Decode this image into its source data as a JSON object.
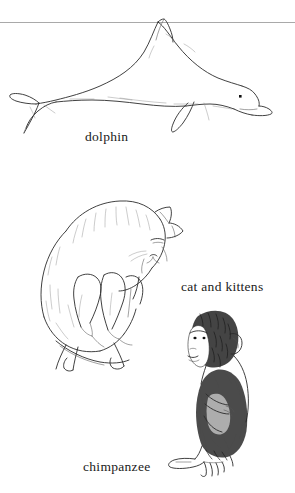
{
  "page": {
    "background_color": "#ffffff",
    "ink_color": "#2b2b2b",
    "rule_color": "#a9a9a9",
    "divider": "horizontal-rule"
  },
  "figures": [
    {
      "id": "dolphin",
      "subject": "dolphin",
      "caption": "dolphin",
      "style": "pen-and-ink line drawing",
      "orientation": "facing right, arched body, dorsal fin touching top rule"
    },
    {
      "id": "cat-and-kittens",
      "subject": "cat and kittens",
      "caption": "cat and kittens",
      "style": "pen-and-ink line drawing with light stippling",
      "orientation": "cat curled on side, head lowered right, kittens nursing below"
    },
    {
      "id": "chimpanzee",
      "subject": "chimpanzee",
      "caption": "chimpanzee",
      "style": "dense pen-and-ink hatching",
      "orientation": "seated in profile, facing left, knees drawn up"
    }
  ],
  "captions": {
    "dolphin": "dolphin",
    "cat_and_kittens": "cat and kittens",
    "chimpanzee": "chimpanzee"
  }
}
